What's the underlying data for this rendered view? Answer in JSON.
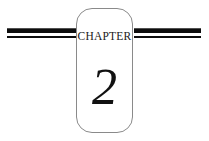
{
  "page": {
    "kind": "book-chapter-heading",
    "background_color": "#ffffff",
    "width": 209,
    "height": 141
  },
  "heading": {
    "chapter_label": "CHAPTER",
    "chapter_number": "2",
    "box": {
      "shape": "rounded-rectangle",
      "border_color": "#8a8a8a",
      "fill_color": "#ffffff",
      "corner_radius_px": 16
    },
    "rules": {
      "color": "#0d0d0d",
      "thick_height_px": 5,
      "thin_height_px": 2,
      "left_segment_label": "left-rule",
      "right_segment_label": "right-rule"
    },
    "text_color": "#1a1a1a",
    "number_color": "#111111"
  }
}
